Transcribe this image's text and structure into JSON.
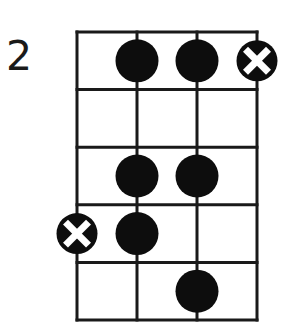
{
  "diagram": {
    "type": "fretboard-scale-diagram",
    "fret_label": "2",
    "strings": 4,
    "frets": 5,
    "colors": {
      "line": "#1a1a1a",
      "dot": "#0d0d0d",
      "background": "#ffffff",
      "x_mark": "#ffffff"
    },
    "markers": [
      {
        "type": "dot",
        "string": 2,
        "fret": 1
      },
      {
        "type": "dot",
        "string": 3,
        "fret": 1
      },
      {
        "type": "x-dot",
        "string": 4,
        "fret": 1
      },
      {
        "type": "dot",
        "string": 2,
        "fret": 3
      },
      {
        "type": "dot",
        "string": 3,
        "fret": 3
      },
      {
        "type": "x-dot",
        "string": 1,
        "fret": 4
      },
      {
        "type": "dot",
        "string": 2,
        "fret": 4
      },
      {
        "type": "dot",
        "string": 3,
        "fret": 5
      }
    ]
  }
}
